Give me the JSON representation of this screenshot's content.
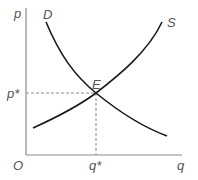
{
  "diagram": {
    "type": "supply-demand",
    "axes": {
      "y_label": "p",
      "x_label": "q",
      "origin_label": "O"
    },
    "curves": {
      "demand": {
        "label": "D"
      },
      "supply": {
        "label": "S"
      }
    },
    "equilibrium": {
      "label": "E",
      "price_label": "p*",
      "quantity_label": "q*"
    },
    "colors": {
      "axis": "#8a8a8a",
      "curve": "#1a1a1a",
      "guide": "#8a8a8a",
      "text": "#555555"
    }
  }
}
